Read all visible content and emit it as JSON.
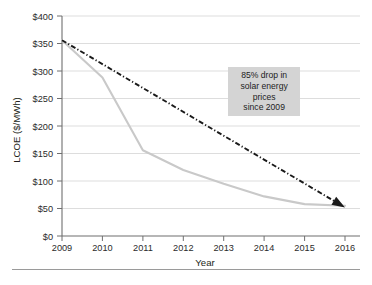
{
  "chart_data": {
    "type": "line",
    "title": "",
    "xlabel": "Year",
    "ylabel": "LCOE ($/MWh)",
    "x": [
      2009,
      2010,
      2011,
      2012,
      2013,
      2014,
      2015,
      2016
    ],
    "xlim": [
      2009,
      2016
    ],
    "ylim": [
      0,
      400
    ],
    "grid": true,
    "legend": "none",
    "x_tick_labels": [
      "2009",
      "2010",
      "2011",
      "2012",
      "2013",
      "2014",
      "2015",
      "2016"
    ],
    "y_tick_values": [
      0,
      50,
      100,
      150,
      200,
      250,
      300,
      350,
      400
    ],
    "y_tick_labels": [
      "$0",
      "$50",
      "$100",
      "$150",
      "$200",
      "$250",
      "$300",
      "$350",
      "$400"
    ],
    "series": [
      {
        "name": "Solar LCOE",
        "style": "solid",
        "color": "#c9c9c9",
        "values": [
          356,
          288,
          156,
          120,
          95,
          72,
          58,
          55
        ]
      },
      {
        "name": "Trend arrow",
        "style": "dash-dot",
        "color": "#1a1a1a",
        "arrow_end": true,
        "values": [
          356,
          312,
          269,
          226,
          182,
          139,
          96,
          52
        ]
      }
    ],
    "annotations": [
      {
        "name": "price-drop-callout",
        "lines": [
          "85% drop in",
          "solar energy",
          "prices",
          "since 2009"
        ],
        "background": "#d4d4d4",
        "x_year": 2014,
        "y_value": 262
      }
    ]
  },
  "axes": {
    "y_title": "LCOE ($/MWh)",
    "x_title": "Year"
  },
  "footer": {
    "smudge_text": ""
  }
}
